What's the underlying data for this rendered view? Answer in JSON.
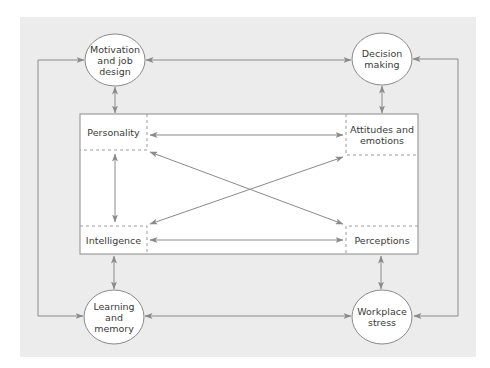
{
  "colors": {
    "panel": "#ececec",
    "box": "#ffffff",
    "line": "#8a8a8a",
    "dash": "#9a9a9a",
    "text": "#3a3a3a"
  },
  "outer_nodes": {
    "motivation": {
      "line1": "Motivation",
      "line2": "and job",
      "line3": "design"
    },
    "decision": {
      "line1": "Decision",
      "line2": "making"
    },
    "learning": {
      "line1": "Learning",
      "line2": "and",
      "line3": "memory"
    },
    "workplace": {
      "line1": "Workplace",
      "line2": "stress"
    }
  },
  "inner_nodes": {
    "personality": "Personality",
    "attitudes": {
      "line1": "Attitudes and",
      "line2": "emotions"
    },
    "intelligence": "Intelligence",
    "perceptions": "Perceptions"
  },
  "connections": [
    [
      "Motivation and job design",
      "Decision making"
    ],
    [
      "Motivation and job design",
      "Learning and memory"
    ],
    [
      "Decision making",
      "Workplace stress"
    ],
    [
      "Learning and memory",
      "Workplace stress"
    ],
    [
      "Motivation and job design",
      "Personality"
    ],
    [
      "Decision making",
      "Attitudes and emotions"
    ],
    [
      "Learning and memory",
      "Intelligence"
    ],
    [
      "Workplace stress",
      "Perceptions"
    ],
    [
      "Personality",
      "Attitudes and emotions"
    ],
    [
      "Personality",
      "Intelligence"
    ],
    [
      "Personality",
      "Perceptions"
    ],
    [
      "Intelligence",
      "Attitudes and emotions"
    ],
    [
      "Intelligence",
      "Perceptions"
    ]
  ]
}
